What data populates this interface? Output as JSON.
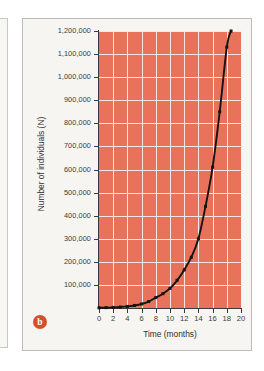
{
  "figure": {
    "panel_label": "b",
    "badge_color": "#d4502a",
    "panel_background": "#f6f5f1",
    "plot_background": "#e8735a",
    "gridline_color": "#f7e9e2",
    "curve_color": "#141414"
  },
  "chart_data": {
    "type": "line",
    "title": "",
    "subtitle": "",
    "xlabel": "Time (months)",
    "ylabel": "Number of individuals (N)",
    "xlim": [
      0,
      20
    ],
    "ylim": [
      0,
      1200000
    ],
    "xticks": [
      0,
      2,
      4,
      6,
      8,
      10,
      12,
      14,
      16,
      18,
      20
    ],
    "xtick_labels": [
      "0",
      "2",
      "4",
      "6",
      "8",
      "10",
      "12",
      "14",
      "16",
      "18",
      "20"
    ],
    "yticks": [
      100000,
      200000,
      300000,
      400000,
      500000,
      600000,
      700000,
      800000,
      900000,
      1000000,
      1100000,
      1200000
    ],
    "ytick_labels": [
      "100,000",
      "200,000",
      "300,000",
      "400,000",
      "500,000",
      "600,000",
      "700,000",
      "800,000",
      "900,000",
      "1,000,000",
      "1,100,000",
      "1,200,000"
    ],
    "grid": true,
    "legend": null,
    "series": [
      {
        "name": "Exponential growth",
        "marker": "square",
        "x": [
          0,
          1,
          2,
          3,
          4,
          5,
          6,
          7,
          8,
          9,
          10,
          11,
          12,
          13,
          14,
          15,
          16,
          17,
          18,
          18.6
        ],
        "y": [
          1000,
          1600,
          2600,
          4200,
          6800,
          11000,
          17500,
          28000,
          45000,
          62000,
          85000,
          120000,
          165000,
          220000,
          300000,
          440000,
          610000,
          850000,
          1130000,
          1200000
        ]
      }
    ],
    "annotations": [
      {
        "text": "b",
        "role": "panel-label",
        "position": "bottom-left"
      }
    ]
  }
}
